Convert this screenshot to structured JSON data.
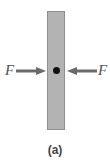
{
  "figure": {
    "caption": "(a)",
    "bar": {
      "color": "#b3b3b3",
      "border": "#8f8f8f"
    },
    "center_point": {
      "color": "#111111"
    },
    "forces": [
      {
        "label": "F",
        "side": "left",
        "direction": "right"
      },
      {
        "label": "F",
        "side": "right",
        "direction": "left"
      }
    ],
    "arrow_color": "#6a6a6a"
  }
}
